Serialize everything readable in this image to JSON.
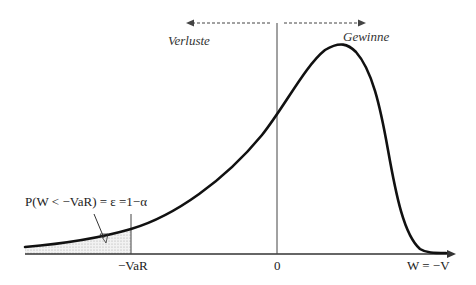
{
  "diagram": {
    "type": "probability-density",
    "labels": {
      "losses": "Verluste",
      "gains": "Gewinne",
      "var_tick": "−VaR",
      "zero_tick": "0",
      "x_axis": "W = −V",
      "probability": "P(W < −VaR) = ε =1−α"
    },
    "colors": {
      "curve": "#111111",
      "axis": "#333333",
      "shaded_area": "#dcdcdc"
    }
  }
}
